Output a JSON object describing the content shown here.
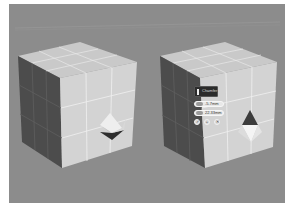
{
  "viewport": {
    "background": "#8c8c8c",
    "label": "3D viewport"
  },
  "scene": {
    "left_cube": {
      "name": "cube-original",
      "grid": "3x3",
      "has_corner_chamfer_preview": true
    },
    "right_cube": {
      "name": "cube-chamfered",
      "grid": "3x3",
      "has_corner_chamfer_preview": true
    }
  },
  "caddy": {
    "title": "Chamfer",
    "fields": [
      {
        "name": "amount",
        "value": "-5.7mm"
      },
      {
        "name": "segments",
        "value": "22.33mm"
      }
    ],
    "buttons": [
      {
        "name": "ok",
        "glyph": "✓"
      },
      {
        "name": "apply-continue",
        "glyph": "+"
      },
      {
        "name": "cancel",
        "glyph": "✕"
      }
    ]
  },
  "colors": {
    "face_light": "#d4d4d4",
    "face_top": "#c8c8c8",
    "face_dark": "#4a4a4a",
    "edge_line": "#f2f2f2",
    "caddy_dark": "#2b2b2b"
  }
}
